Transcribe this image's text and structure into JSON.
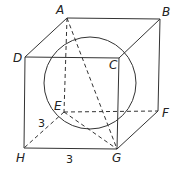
{
  "diagram": {
    "type": "cube-with-inscribed-sphere",
    "vertices": {
      "A": {
        "label": "A",
        "x": 67,
        "y": 18
      },
      "B": {
        "label": "B",
        "x": 160,
        "y": 19
      },
      "C": {
        "label": "C",
        "x": 119,
        "y": 58
      },
      "D": {
        "label": "D",
        "x": 25,
        "y": 57
      },
      "E": {
        "label": "E",
        "x": 64,
        "y": 112
      },
      "F": {
        "label": "F",
        "x": 158,
        "y": 111
      },
      "G": {
        "label": "G",
        "x": 117,
        "y": 149
      },
      "H": {
        "label": "H",
        "x": 24,
        "y": 148
      }
    },
    "sphere": {
      "cx": 90,
      "cy": 83,
      "r": 46
    },
    "edge_labels": [
      {
        "text": "3",
        "edge": "HE"
      },
      {
        "text": "3",
        "edge": "HG"
      }
    ],
    "solid_edges": [
      "AB",
      "BC",
      "CD",
      "DA",
      "BF",
      "FG",
      "GH",
      "HD",
      "CG"
    ],
    "dashed_edges": [
      "AE",
      "EF",
      "EH",
      "AG",
      "EG"
    ],
    "stroke_color": "#333333"
  }
}
